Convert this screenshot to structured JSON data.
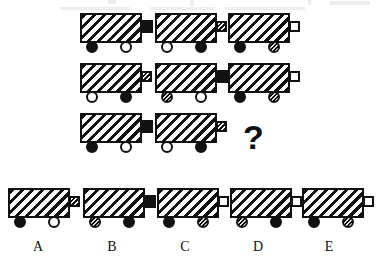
{
  "puzzle": {
    "kind": "visual-analogy-matrix",
    "question_mark": "?",
    "matrix": {
      "rows": 3,
      "cols": 3,
      "cells": [
        {
          "id": "cell-r1c1",
          "name": "matrix-cell-row1-col1",
          "body_fill": "hatch",
          "nozzle_fill": "black",
          "nozzle_size": "large",
          "left_wheel_fill": "black",
          "right_wheel_fill": "white",
          "body_width": "wide"
        },
        {
          "id": "cell-r1c2",
          "name": "matrix-cell-row1-col2",
          "body_fill": "hatch",
          "nozzle_fill": "hatch",
          "nozzle_size": "small",
          "left_wheel_fill": "white",
          "right_wheel_fill": "black",
          "body_width": "wide"
        },
        {
          "id": "cell-r1c3",
          "name": "matrix-cell-row1-col3",
          "body_fill": "hatch",
          "nozzle_fill": "white",
          "nozzle_size": "small",
          "left_wheel_fill": "black",
          "right_wheel_fill": "hatch",
          "body_width": "wide"
        },
        {
          "id": "cell-r2c1",
          "name": "matrix-cell-row2-col1",
          "body_fill": "hatch",
          "nozzle_fill": "hatch",
          "nozzle_size": "small",
          "left_wheel_fill": "white",
          "right_wheel_fill": "black",
          "body_width": "wide"
        },
        {
          "id": "cell-r2c2",
          "name": "matrix-cell-row2-col2",
          "body_fill": "hatch",
          "nozzle_fill": "black",
          "nozzle_size": "large",
          "left_wheel_fill": "hatch",
          "right_wheel_fill": "white",
          "body_width": "wide"
        },
        {
          "id": "cell-r2c3",
          "name": "matrix-cell-row2-col3",
          "body_fill": "hatch",
          "nozzle_fill": "white",
          "nozzle_size": "small",
          "left_wheel_fill": "black",
          "right_wheel_fill": "hatch",
          "body_width": "wide"
        },
        {
          "id": "cell-r3c1",
          "name": "matrix-cell-row3-col1",
          "body_fill": "hatch",
          "nozzle_fill": "black",
          "nozzle_size": "large",
          "left_wheel_fill": "black",
          "right_wheel_fill": "white",
          "body_width": "wide"
        },
        {
          "id": "cell-r3c2",
          "name": "matrix-cell-row3-col2",
          "body_fill": "hatch",
          "nozzle_fill": "hatch",
          "nozzle_size": "small",
          "left_wheel_fill": "white",
          "right_wheel_fill": "black",
          "body_width": "wide"
        },
        {
          "id": "cell-r3c3",
          "name": "matrix-cell-row3-col3-missing",
          "missing": true
        }
      ]
    },
    "options": [
      {
        "id": "option-a",
        "label": "A",
        "body_fill": "hatch",
        "nozzle_fill": "hatch",
        "nozzle_size": "small",
        "left_wheel_fill": "black",
        "right_wheel_fill": "white"
      },
      {
        "id": "option-b",
        "label": "B",
        "body_fill": "hatch",
        "nozzle_fill": "black",
        "nozzle_size": "large",
        "left_wheel_fill": "hatch",
        "right_wheel_fill": "black"
      },
      {
        "id": "option-c",
        "label": "C",
        "body_fill": "hatch",
        "nozzle_fill": "white",
        "nozzle_size": "small",
        "left_wheel_fill": "black",
        "right_wheel_fill": "hatch"
      },
      {
        "id": "option-d",
        "label": "D",
        "body_fill": "hatch",
        "nozzle_fill": "white",
        "nozzle_size": "small",
        "left_wheel_fill": "hatch",
        "right_wheel_fill": "black"
      },
      {
        "id": "option-e",
        "label": "E",
        "body_fill": "hatch",
        "nozzle_fill": "white",
        "nozzle_size": "small",
        "left_wheel_fill": "black",
        "right_wheel_fill": "hatch"
      }
    ]
  },
  "colors": {
    "ink": "#111111",
    "paper": "#ffffff",
    "artifact": "#e8e8e8"
  },
  "layout": {
    "matrix_cell_positions": [
      {
        "x": 80,
        "y": 13
      },
      {
        "x": 155,
        "y": 13
      },
      {
        "x": 228,
        "y": 13
      },
      {
        "x": 80,
        "y": 63
      },
      {
        "x": 155,
        "y": 63
      },
      {
        "x": 228,
        "y": 63
      },
      {
        "x": 80,
        "y": 113
      },
      {
        "x": 155,
        "y": 113
      },
      {
        "x": 228,
        "y": 113
      }
    ],
    "question_mark_position": {
      "x": 243,
      "y": 120
    },
    "option_positions": [
      {
        "x": 8,
        "y": 188
      },
      {
        "x": 83,
        "y": 188
      },
      {
        "x": 157,
        "y": 188
      },
      {
        "x": 230,
        "y": 188
      },
      {
        "x": 302,
        "y": 188
      }
    ],
    "option_letter_positions": [
      {
        "x": 25,
        "y": 240
      },
      {
        "x": 99,
        "y": 240
      },
      {
        "x": 172,
        "y": 240
      },
      {
        "x": 245,
        "y": 240
      },
      {
        "x": 316,
        "y": 240
      }
    ],
    "cart": {
      "body_w": 62,
      "body_h": 30,
      "wheel_d": 12,
      "nozzle_large": {
        "w": 12,
        "h": 13
      },
      "nozzle_small": {
        "w": 11,
        "h": 11
      },
      "left_wheel_x": 6,
      "right_wheel_x": 40
    },
    "top_artifacts": [
      {
        "x": 108,
        "y": 0,
        "w": 8,
        "h": 4
      },
      {
        "x": 190,
        "y": 0,
        "w": 4,
        "h": 6
      },
      {
        "x": 308,
        "y": 0,
        "w": 3,
        "h": 5
      },
      {
        "x": 330,
        "y": 1,
        "w": 40,
        "h": 4
      },
      {
        "x": 60,
        "y": 7,
        "w": 70,
        "h": 3
      },
      {
        "x": 150,
        "y": 7,
        "w": 65,
        "h": 3
      },
      {
        "x": 225,
        "y": 7,
        "w": 80,
        "h": 3
      }
    ]
  }
}
